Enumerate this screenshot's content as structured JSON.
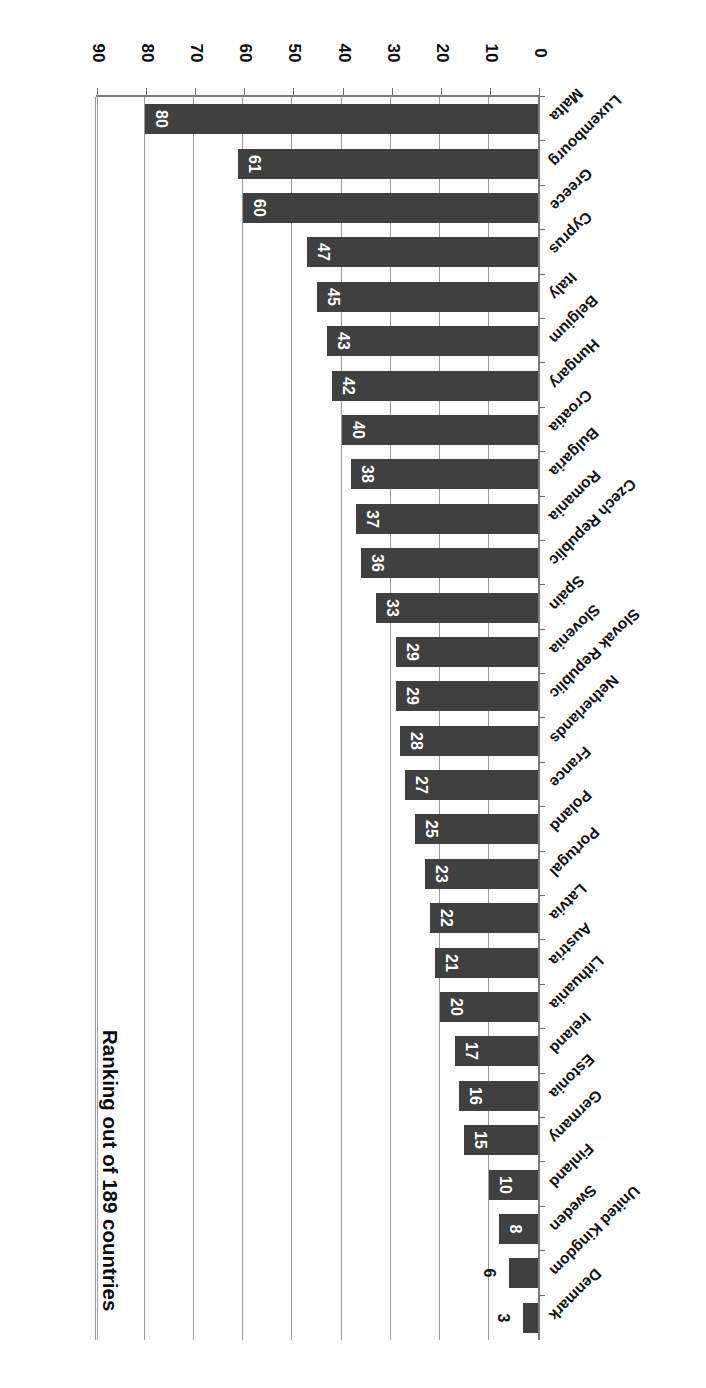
{
  "chart_data": {
    "type": "bar",
    "orientation": "horizontal",
    "title": "Ranking out of 189 countries",
    "xlabel": "",
    "ylabel": "",
    "xlim": [
      0,
      90
    ],
    "ticks": [
      "0",
      "10",
      "20",
      "30",
      "40",
      "50",
      "60",
      "70",
      "80",
      "90"
    ],
    "tick_values": [
      0,
      10,
      20,
      30,
      40,
      50,
      60,
      70,
      80,
      90
    ],
    "grid": true,
    "legend": "none",
    "bar_color": "#404040",
    "value_label_color_inside": "#ffffff",
    "value_label_color_outside": "#101010",
    "categories": [
      "Denmark",
      "United Kingdom",
      "Sweden",
      "Finland",
      "Germany",
      "Estonia",
      "Ireland",
      "Lithuania",
      "Austria",
      "Latvia",
      "Portugal",
      "Poland",
      "France",
      "Netherlands",
      "Slovak Republic",
      "Slovenia",
      "Spain",
      "Czech Republic",
      "Romania",
      "Bulgaria",
      "Croatia",
      "Hungary",
      "Belgium",
      "Italy",
      "Cyprus",
      "Greece",
      "Luxembourg",
      "Malta"
    ],
    "values": [
      3,
      6,
      8,
      10,
      15,
      16,
      17,
      20,
      21,
      22,
      23,
      25,
      27,
      28,
      29,
      29,
      33,
      36,
      37,
      38,
      40,
      42,
      43,
      45,
      47,
      60,
      61,
      80
    ],
    "label_outside": [
      true,
      true,
      false,
      false,
      false,
      false,
      false,
      false,
      false,
      false,
      false,
      false,
      false,
      false,
      false,
      false,
      false,
      false,
      false,
      false,
      false,
      false,
      false,
      false,
      false,
      false,
      false,
      false
    ]
  },
  "figure": {
    "rotated_180": true
  }
}
